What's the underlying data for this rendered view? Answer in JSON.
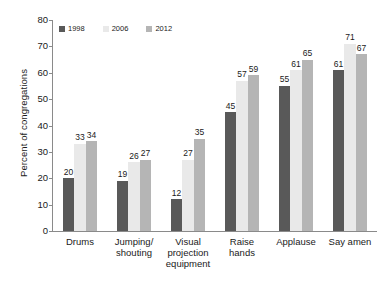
{
  "chart_data": {
    "type": "bar",
    "title": "",
    "subtitle": "",
    "xlabel": "",
    "ylabel": "Percent of congregations",
    "ylim": [
      0,
      80
    ],
    "yticks": [
      0,
      10,
      20,
      30,
      40,
      50,
      60,
      70,
      80
    ],
    "grid": false,
    "legend_position": "top-left",
    "categories": [
      "Drums",
      "Jumping/\nshouting",
      "Visual\nprojection\nequipment",
      "Raise\nhands",
      "Applause",
      "Say amen"
    ],
    "series": [
      {
        "name": "1998",
        "color": "#595959",
        "values": [
          20,
          19,
          12,
          45,
          55,
          61
        ]
      },
      {
        "name": "2006",
        "color": "#e9e9e9",
        "values": [
          33,
          26,
          27,
          57,
          61,
          71
        ]
      },
      {
        "name": "2012",
        "color": "#b5b5b5",
        "values": [
          34,
          27,
          35,
          59,
          65,
          67
        ]
      }
    ]
  },
  "colors": {
    "axis": "#8a8a8a",
    "text": "#1a1a1a",
    "background": "#ffffff",
    "series_1998": "#595959",
    "series_2006": "#e9e9e9",
    "series_2012": "#b5b5b5"
  }
}
